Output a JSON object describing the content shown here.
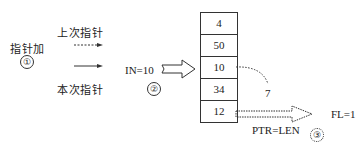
{
  "step1": {
    "label": "指针加",
    "number": "①",
    "prev_pointer_label": "上次指针",
    "curr_pointer_label": "本次指针"
  },
  "step2": {
    "label": "IN=10",
    "number": "②"
  },
  "table": {
    "cells": [
      "4",
      "50",
      "10",
      "34",
      "12"
    ]
  },
  "curve_label": "7",
  "step3": {
    "label": "PTR=LEN",
    "number": "③",
    "result": "FL=1"
  }
}
